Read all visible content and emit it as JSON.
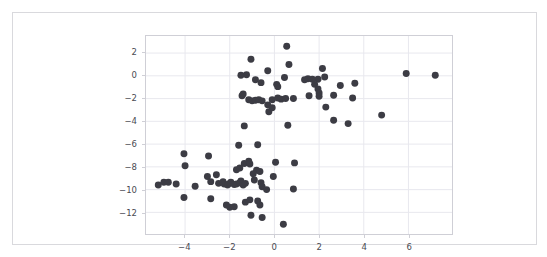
{
  "figure": {
    "background_color": "#ffffff",
    "frame_color": "#d9d9dd",
    "plot_border_color": "#cfcfd6",
    "grid_color": "#e8e8ee",
    "marker_color": "#3c3c44",
    "tick_label_color": "#4a4a52"
  },
  "chart_data": {
    "type": "scatter",
    "title": "",
    "xlabel": "",
    "ylabel": "",
    "xlim": [
      -5.75,
      7.95
    ],
    "ylim": [
      -13.9,
      3.5
    ],
    "grid": true,
    "legend": null,
    "xticks": [
      -4,
      -2,
      0,
      2,
      4,
      6
    ],
    "yticks": [
      2,
      0,
      -2,
      -4,
      -6,
      -8,
      -10,
      -12
    ],
    "xtick_labels": [
      "−4",
      "−2",
      "0",
      "2",
      "4",
      "6"
    ],
    "ytick_labels": [
      "2",
      "0",
      "−2",
      "−4",
      "−6",
      "−8",
      "−10",
      "−12"
    ],
    "marker": {
      "shape": "circle",
      "color": "#3c3c44",
      "size_px": 7,
      "opacity": 1
    },
    "series": [
      {
        "name": "points",
        "points": [
          [
            0.55,
            2.6
          ],
          [
            -1.05,
            1.45
          ],
          [
            0.65,
            1.0
          ],
          [
            -0.3,
            0.45
          ],
          [
            2.15,
            0.65
          ],
          [
            5.9,
            0.2
          ],
          [
            7.2,
            0.05
          ],
          [
            -1.5,
            0.05
          ],
          [
            -1.25,
            0.1
          ],
          [
            0.45,
            -0.15
          ],
          [
            1.5,
            -0.25
          ],
          [
            1.95,
            -0.3
          ],
          [
            2.25,
            -0.1
          ],
          [
            1.35,
            -0.35
          ],
          [
            1.7,
            -0.3
          ],
          [
            -0.85,
            -0.35
          ],
          [
            -0.6,
            -0.6
          ],
          [
            0.1,
            -0.75
          ],
          [
            0.15,
            -0.95
          ],
          [
            1.8,
            -0.75
          ],
          [
            2.95,
            -0.85
          ],
          [
            3.6,
            -0.65
          ],
          [
            1.95,
            -1.15
          ],
          [
            -1.45,
            -1.75
          ],
          [
            -1.4,
            -1.6
          ],
          [
            -1.15,
            -2.1
          ],
          [
            -1.0,
            -2.2
          ],
          [
            -0.85,
            -2.15
          ],
          [
            -0.7,
            -2.1
          ],
          [
            -0.55,
            -2.2
          ],
          [
            -0.3,
            -2.55
          ],
          [
            -0.1,
            -2.1
          ],
          [
            0.15,
            -1.95
          ],
          [
            0.3,
            -2.05
          ],
          [
            0.5,
            -2.0
          ],
          [
            0.85,
            -2.0
          ],
          [
            1.55,
            -1.75
          ],
          [
            2.0,
            -1.5
          ],
          [
            2.0,
            -1.8
          ],
          [
            2.65,
            -1.7
          ],
          [
            3.5,
            -1.95
          ],
          [
            -0.25,
            -3.15
          ],
          [
            2.3,
            -2.75
          ],
          [
            -0.1,
            -2.8
          ],
          [
            4.8,
            -3.45
          ],
          [
            2.65,
            -3.9
          ],
          [
            3.3,
            -4.2
          ],
          [
            0.6,
            -4.35
          ],
          [
            -1.35,
            -4.4
          ],
          [
            -1.6,
            -6.1
          ],
          [
            -0.75,
            -6.05
          ],
          [
            -4.05,
            -6.85
          ],
          [
            -2.95,
            -7.05
          ],
          [
            -4.0,
            -7.9
          ],
          [
            -1.35,
            -7.7
          ],
          [
            -1.15,
            -7.5
          ],
          [
            -1.1,
            -7.75
          ],
          [
            0.05,
            -7.6
          ],
          [
            0.9,
            -7.65
          ],
          [
            -1.7,
            -8.25
          ],
          [
            -1.55,
            -8.1
          ],
          [
            -0.8,
            -8.3
          ],
          [
            -0.65,
            -8.4
          ],
          [
            -0.95,
            -8.6
          ],
          [
            -2.6,
            -8.7
          ],
          [
            -5.2,
            -9.6
          ],
          [
            -4.95,
            -9.35
          ],
          [
            -4.75,
            -9.35
          ],
          [
            -4.4,
            -9.5
          ],
          [
            -3.55,
            -9.7
          ],
          [
            -3.0,
            -8.85
          ],
          [
            -2.85,
            -9.3
          ],
          [
            -2.5,
            -9.45
          ],
          [
            -2.3,
            -9.3
          ],
          [
            -2.25,
            -9.5
          ],
          [
            -2.1,
            -9.6
          ],
          [
            -2.0,
            -9.45
          ],
          [
            -1.95,
            -9.35
          ],
          [
            -1.8,
            -9.55
          ],
          [
            -1.7,
            -9.5
          ],
          [
            -1.55,
            -9.4
          ],
          [
            -1.5,
            -9.25
          ],
          [
            -1.4,
            -9.6
          ],
          [
            -1.3,
            -9.45
          ],
          [
            -0.9,
            -9.15
          ],
          [
            -0.6,
            -9.4
          ],
          [
            -0.05,
            -8.85
          ],
          [
            -0.55,
            -9.75
          ],
          [
            -0.35,
            -10.0
          ],
          [
            0.85,
            -9.95
          ],
          [
            -4.05,
            -10.7
          ],
          [
            -2.85,
            -10.8
          ],
          [
            -2.0,
            -11.55
          ],
          [
            -1.8,
            -11.5
          ],
          [
            -2.15,
            -11.35
          ],
          [
            -1.3,
            -11.1
          ],
          [
            -1.1,
            -10.9
          ],
          [
            -0.75,
            -11.0
          ],
          [
            -0.65,
            -11.35
          ],
          [
            -1.05,
            -12.25
          ],
          [
            -0.55,
            -12.45
          ],
          [
            0.4,
            -13.05
          ]
        ]
      }
    ]
  }
}
